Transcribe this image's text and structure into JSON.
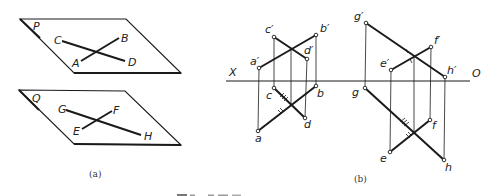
{
  "figure_a": {
    "caption": "(a)",
    "planes": [
      {
        "label": "P",
        "corners": [
          [
            20,
            19
          ],
          [
            126,
            19
          ],
          [
            181,
            73
          ],
          [
            74,
            73
          ]
        ],
        "lines": [
          {
            "from_label": "C",
            "to_label": "D",
            "from": [
              62,
              41
            ],
            "to": [
              125,
              61
            ]
          },
          {
            "from_label": "A",
            "to_label": "B",
            "from": [
              81,
              61
            ],
            "to": [
              119,
              38
            ]
          }
        ]
      },
      {
        "label": "Q",
        "corners": [
          [
            19,
            90
          ],
          [
            125,
            91
          ],
          [
            181,
            145
          ],
          [
            74,
            144
          ]
        ],
        "lines": [
          {
            "from_label": "G",
            "to_label": "H",
            "from": [
              66,
              110
            ],
            "to": [
              141,
              135
            ]
          },
          {
            "from_label": "E",
            "to_label": "F",
            "from": [
              82,
              129
            ],
            "to": [
              112,
              111
            ]
          }
        ]
      }
    ],
    "labels": {
      "P": "P",
      "Q": "Q",
      "A": "A",
      "B": "B",
      "C": "C",
      "D": "D",
      "E": "E",
      "F": "F",
      "G": "G",
      "H": "H"
    }
  },
  "figure_b": {
    "caption": "(b)",
    "axis": {
      "left_label": "X",
      "right_label": "O"
    },
    "labels": {
      "a_prime": "a′",
      "b_prime": "b′",
      "c_prime": "c′",
      "d_prime": "d′",
      "a": "a",
      "b": "b",
      "c": "c",
      "d": "d",
      "e_prime": "e′",
      "f_prime": "f′",
      "g_prime": "g′",
      "h_prime": "h′",
      "e": "e",
      "f": "f",
      "g": "g",
      "h": "h"
    }
  },
  "bottom_caption_cropped": ""
}
